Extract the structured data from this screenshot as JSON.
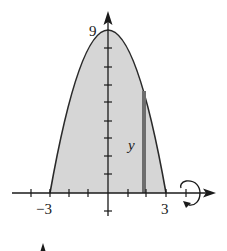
{
  "figure": {
    "type": "solid-of-revolution-diagram",
    "curve": "y = 9 - x^2",
    "region": {
      "x_min": -3,
      "x_max": 3,
      "y_max": 9
    },
    "strip": {
      "x": 1.86,
      "height_label": "y"
    },
    "rotation_axis": "x-axis",
    "labels": {
      "y_top": "9",
      "x_left": "−3",
      "x_right": "3",
      "strip_height": "y"
    },
    "colors": {
      "fill": "#d6d6d6",
      "curve": "#2a2a2a",
      "strip": "#6e6e6e",
      "axis": "#1a1a1a"
    }
  }
}
